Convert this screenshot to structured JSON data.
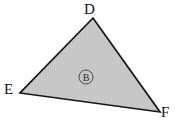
{
  "figure": {
    "background_color": "#ffffff",
    "stroke_color": "#141414",
    "fill_color": "#c9c9c9",
    "fill_pattern": "vertical-stripe-shading",
    "stroke_width": 1.7,
    "vertices": [
      {
        "id": "D",
        "label": "D",
        "x": 93,
        "y": 18,
        "label_x": 84,
        "label_y": 2
      },
      {
        "id": "E",
        "label": "E",
        "x": 20,
        "y": 93,
        "label_x": 4,
        "label_y": 82
      },
      {
        "id": "F",
        "label": "F",
        "x": 160,
        "y": 112,
        "label_x": 161,
        "label_y": 105
      }
    ],
    "edges": [
      {
        "from": "D",
        "to": "E"
      },
      {
        "from": "E",
        "to": "F"
      },
      {
        "from": "F",
        "to": "D"
      }
    ],
    "region": {
      "label": "B",
      "shape": "circle",
      "center_x": 86,
      "center_y": 77,
      "radius": 7,
      "circle_stroke_color": "#3a3a3a",
      "text_color": "#2b2b2b"
    }
  }
}
